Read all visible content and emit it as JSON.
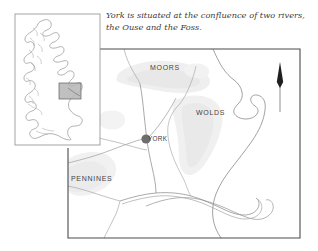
{
  "figure": {
    "caption": "York is situated at the confluence of two rivers,\nthe Ouse and the Foss.",
    "background_color": "#ffffff"
  },
  "inset_map": {
    "name": "Great Britain locator map",
    "border_color": "#9a9a9a",
    "outline_color": "#8a8a8a",
    "highlight_box": {
      "label": "study area highlight",
      "fill_color": "#b5b5b5",
      "border_color": "#5d5d5d"
    }
  },
  "main_map": {
    "border_color": "#4a4a4a",
    "coast_color": "#7d7d7d",
    "river_color": "#8e8e8e",
    "upland_shading_color": "#ededed",
    "labels": [
      {
        "text": "MOORS",
        "x": 150,
        "y": 70
      },
      {
        "text": "WOLDS",
        "x": 196,
        "y": 113
      },
      {
        "text": "PENNINES",
        "x": 68,
        "y": 180
      }
    ],
    "city": {
      "name": "YORK",
      "marker_color": "#6e6e6e",
      "marker_radius": 4.6,
      "x": 146,
      "y": 139
    },
    "north_arrow": {
      "name": "north-arrow",
      "color": "#2b2b2b",
      "x": 280,
      "top_y": 63,
      "bottom_y": 112
    }
  }
}
